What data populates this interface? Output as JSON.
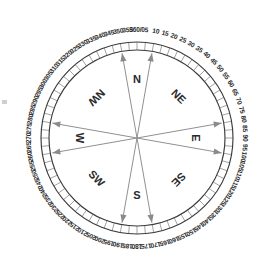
{
  "diagram": {
    "center": {
      "x": 137,
      "y": 138
    },
    "radii": {
      "outer_ring": 96,
      "inner_ring": 88,
      "label_radius": 108,
      "arrow_radius": 86,
      "cardinal_radius": 58
    },
    "colors": {
      "stroke": "#3a3a3a",
      "tick": "#555555",
      "arrow": "#8a8a8a",
      "text": "#2a2a2a",
      "background": "#ffffff"
    },
    "tick_step_degrees": 5,
    "label_step_degrees": 5
  },
  "degree_labels": [
    {
      "deg": 0,
      "text": "360/0"
    },
    {
      "deg": 5,
      "text": "5"
    },
    {
      "deg": 10,
      "text": "10"
    },
    {
      "deg": 15,
      "text": "15"
    },
    {
      "deg": 20,
      "text": "20"
    },
    {
      "deg": 25,
      "text": "25"
    },
    {
      "deg": 30,
      "text": "30"
    },
    {
      "deg": 35,
      "text": "35"
    },
    {
      "deg": 40,
      "text": "40"
    },
    {
      "deg": 45,
      "text": "45"
    },
    {
      "deg": 50,
      "text": "50"
    },
    {
      "deg": 55,
      "text": "55"
    },
    {
      "deg": 60,
      "text": "60"
    },
    {
      "deg": 65,
      "text": "65"
    },
    {
      "deg": 70,
      "text": "70"
    },
    {
      "deg": 75,
      "text": "75"
    },
    {
      "deg": 80,
      "text": "80"
    },
    {
      "deg": 85,
      "text": "85"
    },
    {
      "deg": 90,
      "text": "90"
    },
    {
      "deg": 95,
      "text": "95"
    },
    {
      "deg": 100,
      "text": "100"
    },
    {
      "deg": 105,
      "text": "105"
    },
    {
      "deg": 110,
      "text": "110"
    },
    {
      "deg": 115,
      "text": "115"
    },
    {
      "deg": 120,
      "text": "120"
    },
    {
      "deg": 125,
      "text": "125"
    },
    {
      "deg": 130,
      "text": "130"
    },
    {
      "deg": 135,
      "text": "135"
    },
    {
      "deg": 140,
      "text": "140"
    },
    {
      "deg": 145,
      "text": "145"
    },
    {
      "deg": 150,
      "text": "150"
    },
    {
      "deg": 155,
      "text": "155"
    },
    {
      "deg": 160,
      "text": "160"
    },
    {
      "deg": 165,
      "text": "165"
    },
    {
      "deg": 170,
      "text": "170"
    },
    {
      "deg": 175,
      "text": "175"
    },
    {
      "deg": 180,
      "text": "180"
    },
    {
      "deg": 185,
      "text": "185"
    },
    {
      "deg": 190,
      "text": "190"
    },
    {
      "deg": 195,
      "text": "195"
    },
    {
      "deg": 200,
      "text": "200"
    },
    {
      "deg": 205,
      "text": "205"
    },
    {
      "deg": 210,
      "text": "210"
    },
    {
      "deg": 215,
      "text": "215"
    },
    {
      "deg": 220,
      "text": "220"
    },
    {
      "deg": 225,
      "text": "225"
    },
    {
      "deg": 230,
      "text": "230"
    },
    {
      "deg": 235,
      "text": "235"
    },
    {
      "deg": 240,
      "text": "240"
    },
    {
      "deg": 245,
      "text": "245"
    },
    {
      "deg": 250,
      "text": "250"
    },
    {
      "deg": 255,
      "text": "255"
    },
    {
      "deg": 260,
      "text": "260"
    },
    {
      "deg": 265,
      "text": "265"
    },
    {
      "deg": 270,
      "text": "270"
    },
    {
      "deg": 275,
      "text": "275"
    },
    {
      "deg": 280,
      "text": "280"
    },
    {
      "deg": 285,
      "text": "285"
    },
    {
      "deg": 290,
      "text": "290"
    },
    {
      "deg": 295,
      "text": "295"
    },
    {
      "deg": 300,
      "text": "300"
    },
    {
      "deg": 305,
      "text": "305"
    },
    {
      "deg": 310,
      "text": "310"
    },
    {
      "deg": 315,
      "text": "315"
    },
    {
      "deg": 320,
      "text": "320"
    },
    {
      "deg": 325,
      "text": "325"
    },
    {
      "deg": 330,
      "text": "330"
    },
    {
      "deg": 335,
      "text": "335"
    },
    {
      "deg": 340,
      "text": "340"
    },
    {
      "deg": 345,
      "text": "345"
    },
    {
      "deg": 350,
      "text": "350"
    },
    {
      "deg": 355,
      "text": "355"
    }
  ],
  "cardinal_labels": [
    {
      "name": "north",
      "text": "N",
      "deg": 0,
      "rotation": 0,
      "radius": 58
    },
    {
      "name": "northeast",
      "text": "NE",
      "deg": 45,
      "rotation": 45,
      "radius": 58
    },
    {
      "name": "east",
      "text": "E",
      "deg": 90,
      "rotation": 90,
      "radius": 58
    },
    {
      "name": "southeast",
      "text": "SE",
      "deg": 135,
      "rotation": 135,
      "radius": 58
    },
    {
      "name": "south",
      "text": "S",
      "deg": 180,
      "rotation": 0,
      "radius": 58
    },
    {
      "name": "southwest",
      "text": "SW",
      "deg": 225,
      "rotation": 45,
      "radius": 58
    },
    {
      "name": "west",
      "text": "W",
      "deg": 270,
      "rotation": 90,
      "radius": 58
    },
    {
      "name": "northwest",
      "text": "NW",
      "deg": 315,
      "rotation": 135,
      "radius": 58
    }
  ],
  "arrows": [
    {
      "name": "arrow-350",
      "deg": 350
    },
    {
      "name": "arrow-10",
      "deg": 10
    },
    {
      "name": "arrow-80",
      "deg": 80
    },
    {
      "name": "arrow-100",
      "deg": 100
    },
    {
      "name": "arrow-170",
      "deg": 170
    },
    {
      "name": "arrow-190",
      "deg": 190
    },
    {
      "name": "arrow-260",
      "deg": 260
    },
    {
      "name": "arrow-280",
      "deg": 280
    }
  ]
}
